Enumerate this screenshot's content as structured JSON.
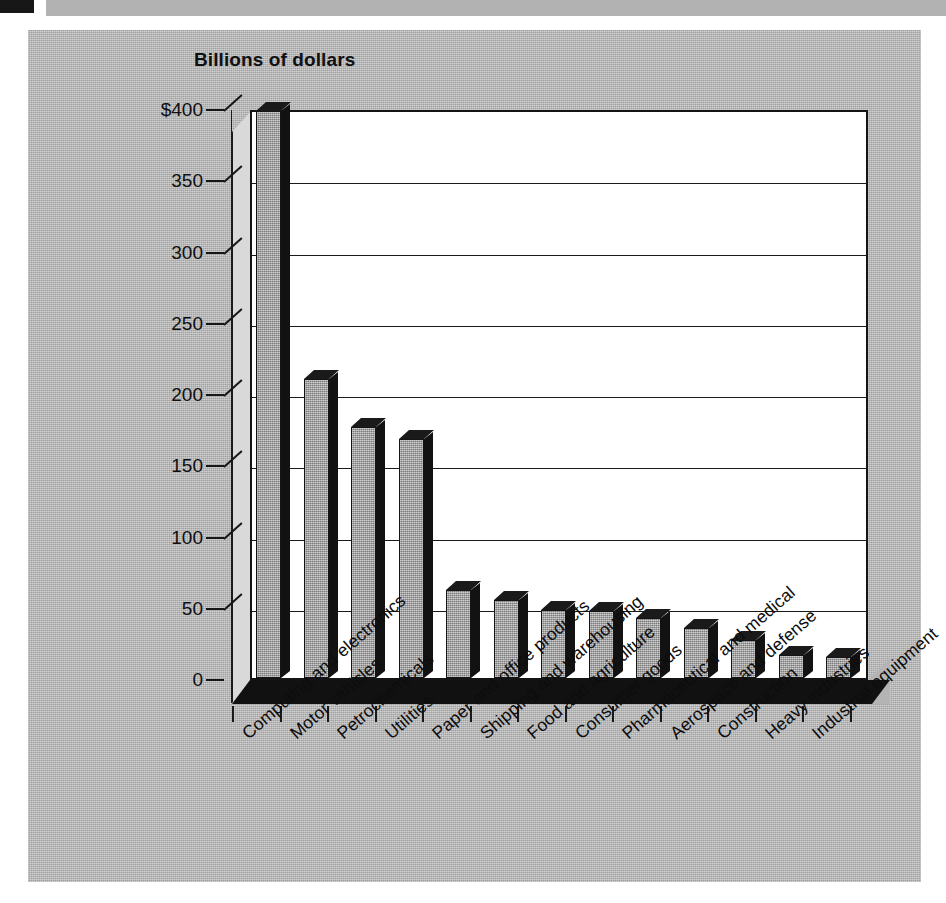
{
  "document": {
    "background_color": "#b4b4b4",
    "page_color": "#ffffff",
    "ink_color": "#121212"
  },
  "chart_data": {
    "type": "bar",
    "title": "Billions of dollars",
    "subtitle": "",
    "xlabel": "",
    "ylabel": "",
    "ylim": [
      0,
      400
    ],
    "grid": true,
    "legend": "none",
    "y_ticks": [
      "$400",
      "350",
      "300",
      "250",
      "200",
      "150",
      "100",
      "50",
      "0"
    ],
    "y_tick_values": [
      400,
      350,
      300,
      250,
      200,
      150,
      100,
      50,
      0
    ],
    "categories": [
      "Computing and electronics",
      "Motor vehicles",
      "Petrochemicals",
      "Utilities",
      "Paper and office products",
      "Shipping and warehousing",
      "Food and agriculture",
      "Consumer goods",
      "Pharmaceutical and medical",
      "Aerospace and defense",
      "Construction",
      "Heavy industries",
      "Industrial equipment"
    ],
    "values": [
      398,
      210,
      176,
      168,
      62,
      55,
      48,
      47,
      42,
      35,
      27,
      16,
      15
    ],
    "bar_color": "#9d9d9d",
    "bar_edge_color": "#141414",
    "style": "3d-column"
  }
}
